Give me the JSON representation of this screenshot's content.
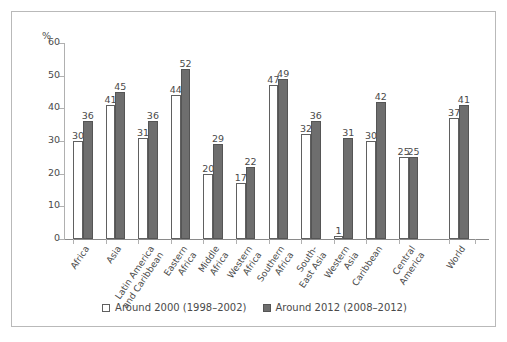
{
  "chart_data": {
    "type": "bar",
    "title": "",
    "subtitle": "",
    "xlabel": "",
    "ylabel": "%",
    "ylim": [
      0,
      60
    ],
    "ytick_step": 10,
    "yticks": [
      "0",
      "10",
      "20",
      "30",
      "40",
      "50",
      "60"
    ],
    "grid": false,
    "legend_position": "bottom-center",
    "value_labels": true,
    "categories": [
      "Africa",
      "Asia",
      "Latin America\nand Caribbean",
      "Eastern\nAfrica",
      "Middle\nAfrica",
      "Western\nAfrica",
      "Southern\nAfrica",
      "South-\nEast Asia",
      "Western\nAsia",
      "Caribbean",
      "Central\nAmerica",
      "World"
    ],
    "series": [
      {
        "name": "Around 2000 (1998–2002)",
        "color": "#ffffff",
        "edge_color": "#606060",
        "values": [
          30,
          41,
          31,
          44,
          20,
          17,
          47,
          32,
          1,
          30,
          25,
          37
        ]
      },
      {
        "name": "Around 2012 (2008–2012)",
        "color": "#6e6e6e",
        "edge_color": "#555555",
        "values": [
          36,
          45,
          36,
          52,
          29,
          22,
          49,
          36,
          31,
          42,
          25,
          41
        ]
      }
    ],
    "group_gap_after_index": 10
  },
  "legend": {
    "items": [
      {
        "label": "Around 2000 (1998–2002)",
        "swatch": "open-square-swatch"
      },
      {
        "label": "Around 2012 (2008–2012)",
        "swatch": "filled-square-swatch"
      }
    ]
  },
  "colors": {
    "series_2000": "#ffffff",
    "series_2012": "#6e6e6e",
    "axis": "#b0b0b0",
    "border": "#b9b9b9",
    "text": "#4a4a4a"
  }
}
